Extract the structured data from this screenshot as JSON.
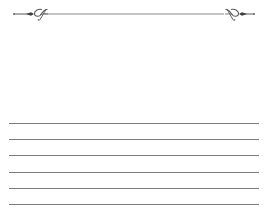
{
  "ornament": {
    "icon": "flourish-divider-icon",
    "color": "#5a5a5a"
  },
  "writing_area": {
    "line_count": 6,
    "line_color": "#7d7d7d"
  }
}
